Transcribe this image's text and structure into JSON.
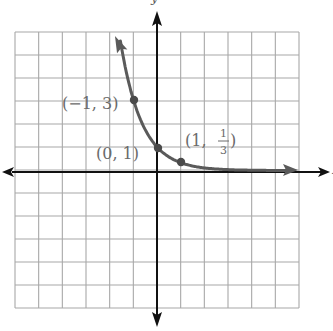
{
  "chart_data": {
    "type": "line",
    "title": "",
    "function": "y = (1/3)^x",
    "xlabel": "x",
    "ylabel": "y",
    "xlim": [
      -6,
      6
    ],
    "ylim": [
      -6,
      5.5
    ],
    "grid": true,
    "grid_step": 1,
    "series": [
      {
        "name": "exponential curve",
        "x": [
          -1.55,
          -1.0,
          -0.5,
          0.0,
          0.5,
          1.0,
          2.0,
          3.0,
          4.0,
          5.7
        ],
        "y": [
          5.5,
          3.0,
          1.732,
          1.0,
          0.577,
          0.333,
          0.111,
          0.037,
          0.012,
          0.002
        ]
      }
    ],
    "points": [
      {
        "x": -1,
        "y": 3,
        "label": "(−1, 3)"
      },
      {
        "x": 0,
        "y": 1,
        "label": "(0, 1)"
      },
      {
        "x": 1,
        "y": 0.333,
        "label_prefix": "(1, ",
        "frac_num": "1",
        "frac_den": "3",
        "label_suffix": ")"
      }
    ],
    "annotations": [
      "(−1, 3)",
      "(0, 1)",
      "(1, 1/3)"
    ],
    "colors": {
      "grid": "#a8a8a8",
      "axis": "#111111",
      "curve": "#5a5a5a",
      "label": "#6a6a6a"
    }
  },
  "labels": {
    "x_axis": "x",
    "y_axis": "y",
    "p1": "(−1, 3)",
    "p2": "(0, 1)",
    "p3_prefix": "(1,",
    "p3_num": "1",
    "p3_den": "3",
    "p3_suffix": ")"
  }
}
